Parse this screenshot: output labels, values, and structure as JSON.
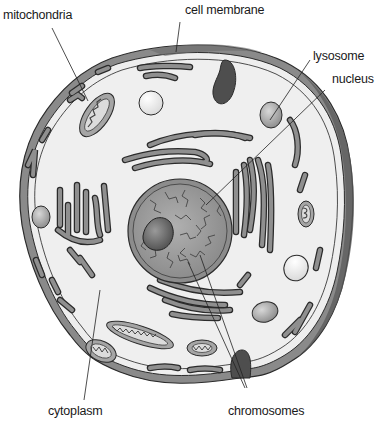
{
  "diagram": {
    "colors": {
      "background": "#ffffff",
      "cytoplasm": "#eeeeee",
      "membrane": "#7a7a7a",
      "membrane_dark": "#555555",
      "organelle": "#8c8c8c",
      "nucleus": "#9a9a9a",
      "nucleolus": "#6e6e6e",
      "vesicle": "#fafafa",
      "outline": "#2b2b2b"
    },
    "labels": [
      {
        "id": "mitochondria",
        "text": "mitochondria"
      },
      {
        "id": "cell-membrane",
        "text": "cell membrane"
      },
      {
        "id": "lysosome",
        "text": "lysosome"
      },
      {
        "id": "nucleus",
        "text": "nucleus"
      },
      {
        "id": "cytoplasm",
        "text": "cytoplasm"
      },
      {
        "id": "chromosomes",
        "text": "chromosomes"
      }
    ]
  }
}
